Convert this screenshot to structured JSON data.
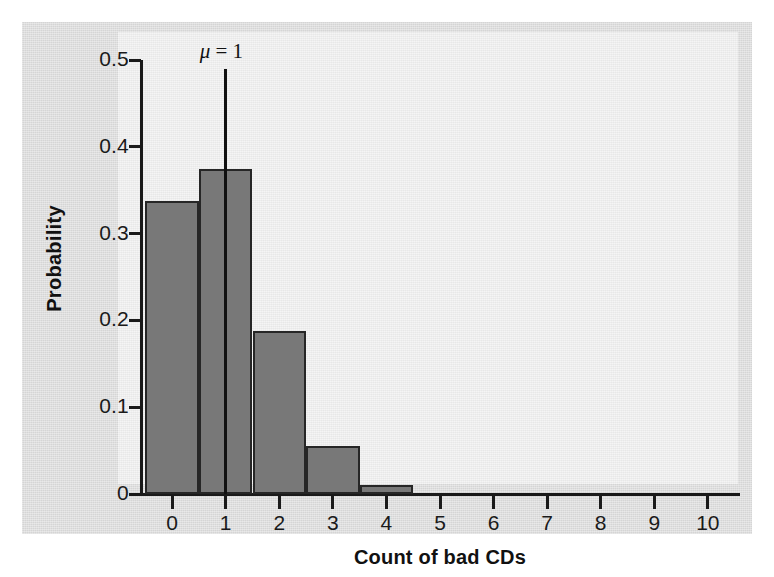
{
  "chart_data": {
    "type": "bar",
    "title": "",
    "xlabel": "Count of bad CDs",
    "ylabel": "Probability",
    "categories": [
      "0",
      "1",
      "2",
      "3",
      "4",
      "5",
      "6",
      "7",
      "8",
      "9",
      "10"
    ],
    "values": [
      0.338,
      0.375,
      0.188,
      0.055,
      0.01,
      0.0,
      0.0,
      0.0,
      0.0,
      0.0,
      0.0
    ],
    "xlim": [
      -0.6,
      10.6
    ],
    "ylim": [
      0,
      0.5
    ],
    "ytick_labels": [
      "0",
      "0.1",
      "0.2",
      "0.3",
      "0.4",
      "0.5"
    ],
    "ytick_values": [
      0,
      0.1,
      0.2,
      0.3,
      0.4,
      0.5
    ],
    "xtick_labels": [
      "0",
      "1",
      "2",
      "3",
      "4",
      "5",
      "6",
      "7",
      "8",
      "9",
      "10"
    ],
    "grid": false,
    "legend": null,
    "annotations": [
      {
        "name": "mean-marker",
        "text_mu": "μ",
        "text_eq": " = 1",
        "x_value": 1,
        "y_top": 0.49,
        "y_bottom": 0.0
      }
    ],
    "bar_fill_color": "#787878",
    "bar_edge_color": "#262626",
    "axis_color": "#1a1a1a",
    "figure_background": "#dcdcdc",
    "panel_background": "#ececec"
  }
}
